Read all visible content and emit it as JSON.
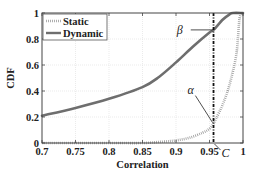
{
  "chart_data": {
    "type": "line",
    "title": "",
    "xlabel": "Correlation",
    "ylabel": "CDF",
    "xlim": [
      0.7,
      1.0
    ],
    "ylim": [
      0,
      1
    ],
    "x_ticks": [
      "0.7",
      "0.75",
      "0.8",
      "0.85",
      "0.9",
      "0.95",
      "1"
    ],
    "y_ticks": [
      "0",
      "0.2",
      "0.4",
      "0.6",
      "0.8",
      "1"
    ],
    "grid": true,
    "legend_position": "upper left",
    "series": [
      {
        "name": "Static",
        "style": "dotted",
        "color": "#9a9a9a",
        "x": [
          0.7,
          0.8,
          0.85,
          0.88,
          0.9,
          0.92,
          0.94,
          0.95,
          0.956,
          0.96,
          0.97,
          0.98,
          0.99,
          0.995,
          1.0
        ],
        "y": [
          0.0,
          0.0,
          0.0,
          0.01,
          0.02,
          0.04,
          0.08,
          0.11,
          0.15,
          0.19,
          0.3,
          0.45,
          0.68,
          0.96,
          1.0
        ]
      },
      {
        "name": "Dynamic",
        "style": "solid",
        "color": "#6e6e6e",
        "x": [
          0.7,
          0.75,
          0.8,
          0.85,
          0.875,
          0.9,
          0.925,
          0.95,
          0.956,
          0.97,
          0.98,
          0.985,
          1.0
        ],
        "y": [
          0.21,
          0.27,
          0.34,
          0.43,
          0.51,
          0.62,
          0.74,
          0.85,
          0.87,
          0.95,
          0.99,
          1.0,
          1.0
        ]
      }
    ],
    "annotations": [
      {
        "text": "β",
        "x": 0.956,
        "y": 0.87,
        "label_x": 0.925,
        "label_y": 0.87
      },
      {
        "text": "α",
        "x": 0.956,
        "y": 0.15,
        "label_x": 0.92,
        "label_y": 0.38
      },
      {
        "text": "C",
        "x": 0.956,
        "y": 0.0,
        "label_x": 0.965,
        "label_y": -0.07
      }
    ],
    "vertical_line": {
      "x": 0.956,
      "style": "dash-dot",
      "color": "#111111"
    }
  },
  "legend": {
    "items": [
      {
        "label": "Static"
      },
      {
        "label": "Dynamic"
      }
    ]
  }
}
